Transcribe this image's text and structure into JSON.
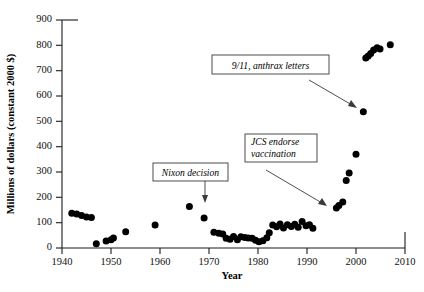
{
  "chart_data": {
    "type": "scatter",
    "title": "",
    "xlabel": "Year",
    "ylabel": "Millions of dollars (constant 2000 $)",
    "xlim": [
      1940,
      2010
    ],
    "ylim": [
      0,
      900
    ],
    "xticks": [
      1940,
      1950,
      1960,
      1970,
      1980,
      1990,
      2000,
      2010
    ],
    "xticklabels": [
      "1940",
      "1950",
      "1960",
      "1970",
      "1980",
      "1990",
      "2000",
      "2010"
    ],
    "yticks": [
      0,
      100,
      200,
      300,
      400,
      500,
      600,
      700,
      800,
      900
    ],
    "yticklabels": [
      "0",
      "100",
      "200",
      "300",
      "400",
      "500",
      "600",
      "700",
      "800",
      "900"
    ],
    "grid": false,
    "legend": null,
    "marker": "filled-circle",
    "marker_color": "#000000",
    "series": [
      {
        "name": "Biodefense funding",
        "points": [
          [
            1942,
            137
          ],
          [
            1943,
            134
          ],
          [
            1944,
            128
          ],
          [
            1945,
            122
          ],
          [
            1946,
            120
          ],
          [
            1947,
            17
          ],
          [
            1949,
            28
          ],
          [
            1950,
            33
          ],
          [
            1950.5,
            39
          ],
          [
            1953,
            64
          ],
          [
            1959,
            91
          ],
          [
            1966,
            164
          ],
          [
            1969,
            118
          ],
          [
            1971,
            62
          ],
          [
            1972,
            58
          ],
          [
            1972.8,
            55
          ],
          [
            1973.5,
            38
          ],
          [
            1974.3,
            35
          ],
          [
            1975,
            45
          ],
          [
            1975.8,
            33
          ],
          [
            1976.5,
            44
          ],
          [
            1977.3,
            41
          ],
          [
            1978,
            39
          ],
          [
            1978.8,
            38
          ],
          [
            1979.5,
            31
          ],
          [
            1980.2,
            25
          ],
          [
            1981,
            29
          ],
          [
            1981.8,
            40
          ],
          [
            1982.3,
            60
          ],
          [
            1983,
            91
          ],
          [
            1983.8,
            84
          ],
          [
            1984.5,
            95
          ],
          [
            1985.2,
            79
          ],
          [
            1986,
            92
          ],
          [
            1986.8,
            85
          ],
          [
            1987.5,
            94
          ],
          [
            1988.2,
            82
          ],
          [
            1989,
            105
          ],
          [
            1989.8,
            88
          ],
          [
            1990.5,
            92
          ],
          [
            1991.2,
            78
          ],
          [
            1996,
            158
          ],
          [
            1996.5,
            168
          ],
          [
            1997.3,
            182
          ],
          [
            1998,
            266
          ],
          [
            1998.6,
            296
          ],
          [
            2000,
            370
          ],
          [
            2001.5,
            538
          ],
          [
            2002,
            750
          ],
          [
            2002.5,
            758
          ],
          [
            2003,
            768
          ],
          [
            2003.6,
            782
          ],
          [
            2004.3,
            790
          ],
          [
            2004.9,
            786
          ],
          [
            2007,
            802
          ]
        ]
      }
    ],
    "annotations": [
      {
        "id": "nixon",
        "lines": [
          "Nixon decision"
        ],
        "target_x": 1969,
        "target_y": 118
      },
      {
        "id": "jcs",
        "lines": [
          "JCS endorse",
          "vaccination"
        ],
        "target_x": 1996,
        "target_y": 158
      },
      {
        "id": "anthrax",
        "lines": [
          "9/11, anthrax letters"
        ],
        "target_x": 2001.5,
        "target_y": 538
      }
    ]
  },
  "axes": {
    "y_title": "Millions of dollars (constant 2000 $)",
    "x_title": "Year"
  },
  "annotation_text": {
    "nixon_line1": "Nixon decision",
    "jcs_line1": "JCS endorse",
    "jcs_line2": "vaccination",
    "anthrax_line1": "9/11, anthrax letters"
  },
  "colors": {
    "marker": "#000000",
    "axis": "#1a1a1a",
    "annotation_border": "#4d4d4d",
    "background": "#ffffff"
  }
}
